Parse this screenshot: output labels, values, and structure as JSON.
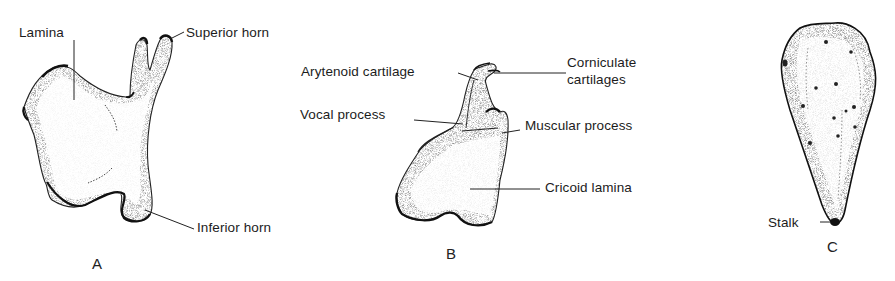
{
  "figure": {
    "panels": [
      {
        "id": "A",
        "letter": "A",
        "structure": "thyroid-cartilage-half",
        "labels": {
          "lamina": "Lamina",
          "superior_horn": "Superior horn",
          "inferior_horn": "Inferior horn"
        }
      },
      {
        "id": "B",
        "letter": "B",
        "structure": "arytenoid-on-cricoid",
        "labels": {
          "arytenoid": "Arytenoid cartilage",
          "corniculate_line1": "Corniculate",
          "corniculate_line2": "cartilages",
          "vocal_process": "Vocal process",
          "muscular_process": "Muscular process",
          "cricoid_lamina": "Cricoid lamina"
        }
      },
      {
        "id": "C",
        "letter": "C",
        "structure": "epiglottis",
        "labels": {
          "stalk": "Stalk"
        }
      }
    ],
    "colors": {
      "ink": "#1a1a1a",
      "background": "#ffffff",
      "stipple": "#555555"
    }
  }
}
